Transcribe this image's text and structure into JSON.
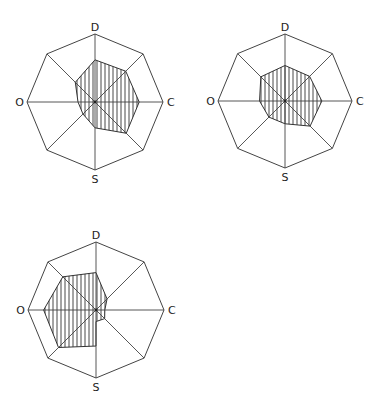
{
  "chart_data": [
    {
      "type": "radar",
      "title": "",
      "axes": [
        "D",
        "C",
        "S",
        "O"
      ],
      "spokes": [
        "N",
        "NE",
        "E",
        "SE",
        "S",
        "SW",
        "W",
        "NW"
      ],
      "range": [
        0,
        1
      ],
      "grid": false,
      "fill": "vertical-hatch",
      "center": [
        95,
        102
      ],
      "radius": 68,
      "values": {
        "N": 0.62,
        "NE": 0.64,
        "E": 0.65,
        "SE": 0.65,
        "S": 0.38,
        "SW": 0.25,
        "W": 0.25,
        "NW": 0.41
      }
    },
    {
      "type": "radar",
      "title": "",
      "axes": [
        "D",
        "C",
        "S",
        "O"
      ],
      "spokes": [
        "N",
        "NE",
        "E",
        "SE",
        "S",
        "SW",
        "W",
        "NW"
      ],
      "range": [
        0,
        1
      ],
      "grid": false,
      "fill": "vertical-hatch",
      "center": [
        285,
        101
      ],
      "radius": 67,
      "values": {
        "N": 0.53,
        "NE": 0.52,
        "E": 0.55,
        "SE": 0.53,
        "S": 0.34,
        "SW": 0.34,
        "W": 0.38,
        "NW": 0.51
      }
    },
    {
      "type": "radar",
      "title": "",
      "axes": [
        "D",
        "C",
        "S",
        "O"
      ],
      "spokes": [
        "N",
        "NE",
        "E",
        "SE",
        "S",
        "SW",
        "W",
        "NW"
      ],
      "range": [
        0,
        1
      ],
      "grid": false,
      "fill": "vertical-hatch",
      "center": [
        96,
        310
      ],
      "radius": 68,
      "values": {
        "N": 0.55,
        "NE": 0.23,
        "E": 0.13,
        "SE": 0.18,
        "S": 0.53,
        "SW": 0.78,
        "W": 0.77,
        "NW": 0.69
      },
      "notes": "S spoke: right lobe closes at ~0.17 on S axis, left region extends to 0.53"
    }
  ],
  "labels": {
    "top": "D",
    "right": "C",
    "bottom": "S",
    "left": "O"
  }
}
